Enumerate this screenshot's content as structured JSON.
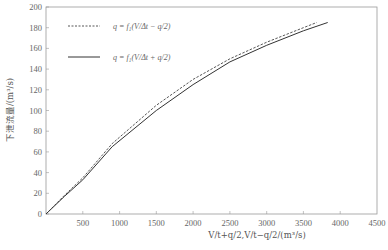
{
  "chart_data": {
    "type": "line",
    "title": "",
    "xlabel": "V/t+q/2,V/t−q/2/(m³/s)",
    "ylabel": "下泄流量/(m³/s)",
    "xlim": [
      0,
      4500
    ],
    "ylim": [
      0,
      200
    ],
    "x_ticks": [
      500,
      1000,
      1500,
      2000,
      2500,
      3000,
      3500,
      4000,
      4500
    ],
    "y_ticks": [
      0,
      20,
      40,
      60,
      80,
      100,
      120,
      140,
      160,
      180,
      200
    ],
    "grid": false,
    "legend_position": "upper-left",
    "series": [
      {
        "name": "q = f₁(V/Δt − q/2)",
        "style": "dashed",
        "x": [
          0,
          250,
          500,
          900,
          1500,
          2000,
          2500,
          3000,
          3500,
          3680
        ],
        "y": [
          0,
          18,
          35,
          68,
          105,
          130,
          150,
          166,
          180,
          185
        ]
      },
      {
        "name": "q = f₁(V/Δt + q/2)",
        "style": "solid",
        "x": [
          0,
          250,
          500,
          900,
          1500,
          2000,
          2500,
          3000,
          3500,
          3830
        ],
        "y": [
          0,
          17,
          33,
          65,
          100,
          125,
          147,
          163,
          177,
          185
        ]
      }
    ]
  },
  "labels": {
    "ylabel": "下泄流量/(m³/s)",
    "xlabel": "V/t+q/2,V/t−q/2/(m³/s)",
    "legend_dashed": "q = f₁(V/Δt − q/2)",
    "legend_solid": "q = f₁(V/Δt + q/2)",
    "y0": "0",
    "y20": "20",
    "y40": "40",
    "y60": "60",
    "y80": "80",
    "y100": "100",
    "y120": "120",
    "y140": "140",
    "y160": "160",
    "y180": "180",
    "y200": "200",
    "x500": "500",
    "x1000": "1000",
    "x1500": "1500",
    "x2000": "2000",
    "x2500": "2500",
    "x3000": "3000",
    "x3500": "3500",
    "x4000": "4000",
    "x4500": "4500"
  }
}
